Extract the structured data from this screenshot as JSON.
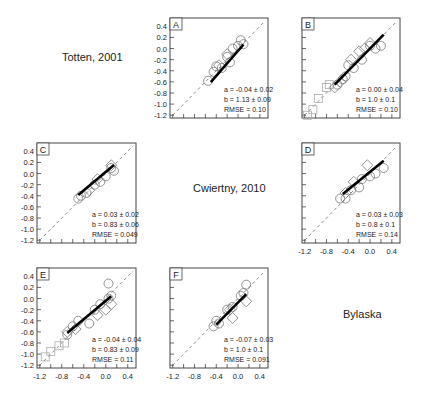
{
  "labels": {
    "totten": "Totten, 2001",
    "cwiertny": "Cwiertny, 2010",
    "bylaska": "Bylaska"
  },
  "chart_data": [
    {
      "panel": "A",
      "type": "scatter",
      "xlim": [
        -1.25,
        0.55
      ],
      "ylim": [
        -1.25,
        0.55
      ],
      "yticklabels": [
        "0.4",
        "0.2",
        "0.0",
        "-0.2",
        "-0.4",
        "-0.6",
        "-0.8",
        "-1.0",
        "-1.2"
      ],
      "xticklabels": [],
      "stats": [
        "a = -0.04 ± 0.02",
        "b = 1.13 ± 0.09",
        "RMSE = 0.10"
      ],
      "fit": {
        "x": [
          -0.5,
          0.1
        ]
      },
      "slope": 1.13,
      "intercept": -0.04,
      "circles": [
        [
          -0.55,
          -0.58
        ],
        [
          -0.45,
          -0.42
        ],
        [
          -0.4,
          -0.32
        ],
        [
          -0.3,
          -0.35
        ],
        [
          -0.2,
          -0.15
        ],
        [
          -0.15,
          -0.25
        ],
        [
          -0.1,
          0.0
        ],
        [
          0.0,
          0.05
        ],
        [
          0.05,
          0.15
        ],
        [
          0.1,
          0.08
        ]
      ],
      "diamonds": [
        [
          -0.35,
          -0.3
        ],
        [
          -0.2,
          -0.1
        ]
      ],
      "squares": []
    },
    {
      "panel": "B",
      "type": "scatter",
      "xlim": [
        -1.25,
        0.55
      ],
      "ylim": [
        -1.25,
        0.55
      ],
      "yticklabels": [],
      "xticklabels": [],
      "stats": [
        "a = 0.00 ± 0.04",
        "b = 1.0 ± 0.1",
        "RMSE = 0.10"
      ],
      "fit": {
        "x": [
          -0.65,
          0.25
        ]
      },
      "slope": 1.0,
      "intercept": 0.0,
      "circles": [
        [
          -0.6,
          -0.65
        ],
        [
          -0.45,
          -0.5
        ],
        [
          -0.4,
          -0.3
        ],
        [
          -0.3,
          -0.35
        ],
        [
          -0.15,
          -0.2
        ],
        [
          0.0,
          0.05
        ],
        [
          0.1,
          0.0
        ],
        [
          0.2,
          0.05
        ],
        [
          -0.5,
          -0.55
        ]
      ],
      "diamonds": [
        [
          -0.65,
          -0.7
        ],
        [
          -0.55,
          -0.6
        ],
        [
          -0.35,
          -0.2
        ],
        [
          -0.2,
          -0.05
        ],
        [
          -0.1,
          0.0
        ],
        [
          0.0,
          0.1
        ]
      ],
      "squares": [
        [
          -1.05,
          -1.1
        ],
        [
          -0.95,
          -0.9
        ],
        [
          -0.8,
          -0.7
        ],
        [
          -0.75,
          -0.65
        ],
        [
          -1.15,
          -1.2
        ]
      ]
    },
    {
      "panel": "C",
      "type": "scatter",
      "xlim": [
        -1.25,
        0.55
      ],
      "ylim": [
        -1.25,
        0.55
      ],
      "yticklabels": [
        "0.4",
        "0.2",
        "0.0",
        "-0.2",
        "-0.4",
        "-0.6",
        "-0.8",
        "-1.0",
        "-1.2"
      ],
      "xticklabels": [],
      "stats": [
        "a = 0.03 ± 0.02",
        "b = 0.83 ± 0.06",
        "RMSE = 0.049"
      ],
      "fit": {
        "x": [
          -0.5,
          0.15
        ]
      },
      "slope": 0.83,
      "intercept": 0.03,
      "circles": [
        [
          -0.5,
          -0.45
        ],
        [
          -0.45,
          -0.4
        ],
        [
          -0.35,
          -0.35
        ],
        [
          -0.2,
          -0.2
        ],
        [
          -0.1,
          -0.15
        ],
        [
          0.0,
          -0.05
        ],
        [
          0.1,
          0.1
        ],
        [
          0.15,
          0.05
        ]
      ],
      "diamonds": [
        [
          -0.3,
          -0.3
        ],
        [
          -0.15,
          -0.1
        ],
        [
          0.1,
          0.15
        ]
      ],
      "squares": []
    },
    {
      "panel": "D",
      "type": "scatter",
      "xlim": [
        -1.25,
        0.55
      ],
      "ylim": [
        -1.25,
        0.55
      ],
      "yticklabels": [],
      "xticklabels": [
        "-1.2",
        "-0.8",
        "-0.4",
        "0.0",
        "0.4"
      ],
      "stats": [
        "a = 0.03 ± 0.03",
        "b = 0.8 ± 0.1",
        "RMSE = 0.14"
      ],
      "fit": {
        "x": [
          -0.5,
          0.25
        ]
      },
      "slope": 0.8,
      "intercept": 0.03,
      "circles": [
        [
          -0.55,
          -0.45
        ],
        [
          -0.45,
          -0.45
        ],
        [
          -0.35,
          -0.3
        ],
        [
          -0.2,
          -0.25
        ],
        [
          -0.15,
          -0.1
        ],
        [
          0.0,
          -0.05
        ],
        [
          0.1,
          0.0
        ],
        [
          0.25,
          0.1
        ]
      ],
      "diamonds": [
        [
          -0.45,
          -0.35
        ],
        [
          -0.3,
          -0.15
        ],
        [
          -0.05,
          0.15
        ]
      ],
      "squares": []
    },
    {
      "panel": "E",
      "type": "scatter",
      "xlim": [
        -1.25,
        0.55
      ],
      "ylim": [
        -1.25,
        0.55
      ],
      "yticklabels": [
        "0.4",
        "0.2",
        "0.0",
        "-0.2",
        "-0.4",
        "-0.6",
        "-0.8",
        "-1.0",
        "-1.2"
      ],
      "xticklabels": [
        "-1.2",
        "-0.8",
        "-0.4",
        "0.0",
        "0.4"
      ],
      "stats": [
        "a = -0.04 ± 0.04",
        "b = 0.83 ± 0.09",
        "RMSE = 0.11"
      ],
      "fit": {
        "x": [
          -0.7,
          0.1
        ]
      },
      "slope": 0.83,
      "intercept": -0.04,
      "circles": [
        [
          -0.7,
          -0.65
        ],
        [
          -0.6,
          -0.5
        ],
        [
          -0.5,
          -0.4
        ],
        [
          -0.3,
          -0.45
        ],
        [
          -0.2,
          -0.2
        ],
        [
          0.05,
          0.27
        ],
        [
          0.05,
          0.0
        ],
        [
          0.1,
          0.05
        ],
        [
          -0.1,
          -0.1
        ]
      ],
      "diamonds": [
        [
          -0.7,
          -0.6
        ],
        [
          -0.55,
          -0.55
        ],
        [
          -0.15,
          -0.3
        ],
        [
          0.0,
          -0.2
        ],
        [
          0.1,
          -0.1
        ]
      ],
      "squares": [
        [
          -0.75,
          -0.8
        ],
        [
          -1.0,
          -0.95
        ],
        [
          -1.1,
          -1.05
        ],
        [
          -0.85,
          -0.85
        ]
      ]
    },
    {
      "panel": "F",
      "type": "scatter",
      "xlim": [
        -1.25,
        0.55
      ],
      "ylim": [
        -1.25,
        0.55
      ],
      "yticklabels": [],
      "xticklabels": [
        "-1.2",
        "-0.8",
        "-0.4",
        "0.0",
        "0.4"
      ],
      "stats": [
        "a = -0.07 ± 0.03",
        "b = 1.0 ± 0.1",
        "RMSE = 0.091"
      ],
      "fit": {
        "x": [
          -0.4,
          0.15
        ]
      },
      "slope": 1.0,
      "intercept": -0.07,
      "circles": [
        [
          -0.45,
          -0.5
        ],
        [
          -0.4,
          -0.4
        ],
        [
          -0.35,
          -0.45
        ],
        [
          -0.2,
          -0.2
        ],
        [
          -0.1,
          -0.15
        ],
        [
          0.05,
          0.05
        ],
        [
          0.15,
          0.25
        ],
        [
          0.1,
          0.1
        ]
      ],
      "diamonds": [
        [
          -0.15,
          -0.2
        ],
        [
          -0.1,
          -0.35
        ],
        [
          0.15,
          -0.05
        ]
      ],
      "squares": []
    }
  ]
}
